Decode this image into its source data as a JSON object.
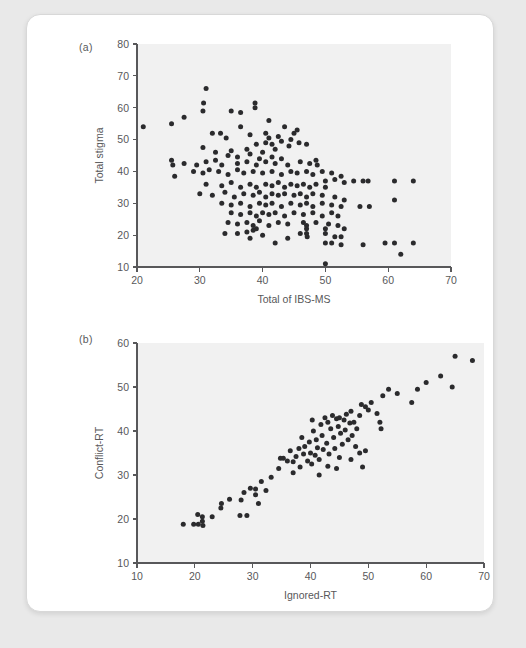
{
  "figure": {
    "panels": [
      {
        "id": "a",
        "label": "(a)",
        "xlabel": "Total of IBS-MS",
        "ylabel": "Total stigma"
      },
      {
        "id": "b",
        "label": "(b)",
        "xlabel": "Ignored-RT",
        "ylabel": "Conflict-RT"
      }
    ]
  },
  "colors": {
    "page_background": "#e9e9e9",
    "card_background": "#ffffff",
    "plot_background": "#f1f1f1",
    "point_color": "#2b2b2d",
    "axis_color": "#58585a",
    "text_color": "#58585a"
  },
  "chart_data": [
    {
      "type": "scatter",
      "panel": "a",
      "title": "(a)",
      "xlabel": "Total of IBS-MS",
      "ylabel": "Total stigma",
      "xlim": [
        20,
        70
      ],
      "ylim": [
        10,
        80
      ],
      "xticks": [
        20,
        30,
        40,
        50,
        60,
        70
      ],
      "yticks": [
        10,
        20,
        30,
        40,
        50,
        60,
        70,
        80
      ],
      "grid": false,
      "legend": "none",
      "relationship": "negative",
      "points": [
        [
          21.0,
          54.0
        ],
        [
          25.5,
          55.0
        ],
        [
          27.5,
          57.0
        ],
        [
          31.0,
          66.0
        ],
        [
          30.5,
          59.0
        ],
        [
          30.6,
          61.5
        ],
        [
          35.0,
          59.0
        ],
        [
          36.5,
          58.5
        ],
        [
          38.8,
          61.5
        ],
        [
          38.8,
          60.0
        ],
        [
          33.3,
          52.0
        ],
        [
          36.5,
          54.0
        ],
        [
          41.0,
          56.0
        ],
        [
          43.5,
          54.0
        ],
        [
          45.5,
          53.0
        ],
        [
          32.0,
          52.0
        ],
        [
          34.2,
          50.5
        ],
        [
          38.0,
          51.5
        ],
        [
          40.5,
          52.0
        ],
        [
          41.0,
          50.5
        ],
        [
          42.5,
          51.0
        ],
        [
          44.5,
          50.0
        ],
        [
          45.0,
          52.0
        ],
        [
          39.0,
          48.5
        ],
        [
          40.5,
          49.0
        ],
        [
          41.5,
          48.5
        ],
        [
          43.0,
          49.5
        ],
        [
          44.2,
          48.0
        ],
        [
          45.8,
          49.0
        ],
        [
          47.0,
          48.5
        ],
        [
          30.5,
          47.5
        ],
        [
          32.5,
          46.0
        ],
        [
          35.0,
          46.5
        ],
        [
          37.5,
          47.0
        ],
        [
          38.0,
          45.5
        ],
        [
          40.0,
          46.0
        ],
        [
          42.0,
          47.0
        ],
        [
          34.5,
          45.0
        ],
        [
          36.0,
          44.5
        ],
        [
          39.5,
          44.0
        ],
        [
          41.5,
          44.5
        ],
        [
          43.0,
          44.0
        ],
        [
          25.5,
          43.5
        ],
        [
          25.7,
          42.0
        ],
        [
          27.5,
          42.5
        ],
        [
          29.5,
          42.0
        ],
        [
          31.0,
          43.0
        ],
        [
          32.5,
          43.5
        ],
        [
          33.5,
          42.0
        ],
        [
          36.0,
          42.5
        ],
        [
          37.5,
          43.0
        ],
        [
          39.0,
          42.0
        ],
        [
          40.5,
          43.0
        ],
        [
          42.0,
          42.5
        ],
        [
          44.0,
          42.0
        ],
        [
          46.0,
          43.0
        ],
        [
          47.5,
          42.5
        ],
        [
          48.5,
          43.5
        ],
        [
          48.7,
          42.0
        ],
        [
          26.0,
          38.5
        ],
        [
          29.0,
          40.0
        ],
        [
          30.5,
          39.5
        ],
        [
          31.5,
          40.5
        ],
        [
          33.0,
          40.0
        ],
        [
          34.5,
          39.0
        ],
        [
          36.0,
          40.5
        ],
        [
          37.0,
          39.5
        ],
        [
          38.5,
          40.0
        ],
        [
          40.0,
          39.5
        ],
        [
          41.5,
          40.0
        ],
        [
          43.0,
          39.0
        ],
        [
          44.5,
          40.0
        ],
        [
          45.5,
          39.5
        ],
        [
          47.0,
          40.0
        ],
        [
          48.0,
          39.0
        ],
        [
          49.5,
          40.0
        ],
        [
          51.0,
          39.5
        ],
        [
          52.5,
          38.5
        ],
        [
          54.5,
          37.0
        ],
        [
          56.0,
          37.0
        ],
        [
          56.8,
          37.0
        ],
        [
          61.0,
          37.0
        ],
        [
          64.0,
          37.0
        ],
        [
          51.5,
          37.5
        ],
        [
          53.0,
          36.5
        ],
        [
          50.0,
          37.0
        ],
        [
          31.0,
          36.0
        ],
        [
          33.5,
          35.5
        ],
        [
          35.0,
          36.5
        ],
        [
          36.5,
          35.0
        ],
        [
          38.0,
          36.0
        ],
        [
          39.0,
          35.0
        ],
        [
          40.5,
          36.0
        ],
        [
          41.5,
          35.5
        ],
        [
          42.5,
          36.5
        ],
        [
          43.5,
          35.0
        ],
        [
          44.5,
          36.0
        ],
        [
          45.5,
          35.5
        ],
        [
          46.5,
          36.0
        ],
        [
          47.5,
          35.0
        ],
        [
          48.5,
          36.0
        ],
        [
          50.0,
          35.0
        ],
        [
          30.0,
          33.0
        ],
        [
          32.0,
          32.5
        ],
        [
          34.0,
          33.5
        ],
        [
          35.5,
          32.0
        ],
        [
          37.0,
          33.0
        ],
        [
          38.5,
          32.5
        ],
        [
          39.5,
          33.5
        ],
        [
          40.5,
          32.0
        ],
        [
          41.5,
          33.0
        ],
        [
          42.5,
          32.5
        ],
        [
          43.5,
          33.0
        ],
        [
          45.0,
          32.5
        ],
        [
          46.0,
          33.0
        ],
        [
          47.0,
          32.0
        ],
        [
          48.0,
          33.0
        ],
        [
          49.5,
          32.5
        ],
        [
          51.5,
          32.0
        ],
        [
          53.0,
          31.0
        ],
        [
          61.0,
          31.0
        ],
        [
          33.5,
          30.0
        ],
        [
          35.0,
          29.5
        ],
        [
          36.5,
          30.0
        ],
        [
          38.0,
          29.0
        ],
        [
          39.5,
          30.0
        ],
        [
          40.5,
          29.5
        ],
        [
          41.5,
          30.0
        ],
        [
          43.0,
          29.0
        ],
        [
          44.5,
          30.0
        ],
        [
          46.0,
          29.5
        ],
        [
          47.0,
          30.0
        ],
        [
          48.0,
          29.0
        ],
        [
          49.5,
          30.0
        ],
        [
          51.0,
          29.5
        ],
        [
          52.5,
          29.0
        ],
        [
          55.5,
          29.0
        ],
        [
          57.0,
          29.0
        ],
        [
          35.0,
          27.0
        ],
        [
          36.5,
          26.5
        ],
        [
          38.0,
          27.0
        ],
        [
          39.0,
          26.0
        ],
        [
          40.0,
          27.0
        ],
        [
          41.0,
          26.5
        ],
        [
          42.0,
          27.0
        ],
        [
          43.5,
          26.0
        ],
        [
          45.0,
          27.0
        ],
        [
          46.5,
          26.5
        ],
        [
          48.0,
          27.0
        ],
        [
          49.5,
          26.0
        ],
        [
          51.0,
          27.0
        ],
        [
          52.0,
          26.0
        ],
        [
          34.5,
          24.0
        ],
        [
          36.0,
          23.5
        ],
        [
          37.5,
          24.0
        ],
        [
          38.5,
          23.0
        ],
        [
          39.5,
          24.5
        ],
        [
          41.0,
          23.0
        ],
        [
          42.5,
          24.0
        ],
        [
          44.0,
          23.5
        ],
        [
          46.5,
          24.0
        ],
        [
          47.0,
          23.0
        ],
        [
          48.5,
          24.0
        ],
        [
          50.5,
          23.5
        ],
        [
          52.0,
          23.0
        ],
        [
          53.0,
          22.0
        ],
        [
          34.0,
          20.5
        ],
        [
          36.0,
          20.5
        ],
        [
          37.5,
          21.0
        ],
        [
          38.5,
          21.5
        ],
        [
          39.0,
          22.0
        ],
        [
          38.0,
          19.0
        ],
        [
          40.0,
          20.0
        ],
        [
          42.0,
          17.5
        ],
        [
          44.0,
          19.0
        ],
        [
          46.0,
          20.5
        ],
        [
          47.0,
          22.0
        ],
        [
          47.0,
          20.5
        ],
        [
          47.1,
          19.5
        ],
        [
          50.0,
          22.0
        ],
        [
          50.0,
          20.5
        ],
        [
          51.5,
          19.5
        ],
        [
          52.5,
          19.5
        ],
        [
          50.0,
          17.5
        ],
        [
          51.0,
          17.5
        ],
        [
          52.5,
          17.0
        ],
        [
          56.0,
          17.0
        ],
        [
          59.5,
          17.5
        ],
        [
          61.0,
          17.5
        ],
        [
          64.0,
          17.5
        ],
        [
          62.0,
          14.0
        ],
        [
          50.0,
          11.0
        ]
      ]
    },
    {
      "type": "scatter",
      "panel": "b",
      "title": "(b)",
      "xlabel": "Ignored-RT",
      "ylabel": "Conflict-RT",
      "xlim": [
        10,
        70
      ],
      "ylim": [
        10,
        60
      ],
      "xticks": [
        10,
        20,
        30,
        40,
        50,
        60,
        70
      ],
      "yticks": [
        10,
        20,
        30,
        40,
        50,
        60
      ],
      "grid": false,
      "legend": "none",
      "relationship": "positive",
      "points": [
        [
          18.0,
          18.8
        ],
        [
          19.8,
          18.8
        ],
        [
          20.6,
          18.8
        ],
        [
          21.3,
          19.5
        ],
        [
          21.3,
          20.5
        ],
        [
          21.4,
          18.5
        ],
        [
          20.5,
          21.0
        ],
        [
          23.0,
          20.5
        ],
        [
          24.5,
          22.5
        ],
        [
          24.6,
          23.5
        ],
        [
          26.0,
          24.5
        ],
        [
          28.0,
          24.3
        ],
        [
          27.8,
          20.8
        ],
        [
          29.0,
          20.8
        ],
        [
          28.5,
          26.0
        ],
        [
          29.6,
          27.0
        ],
        [
          30.5,
          25.5
        ],
        [
          30.5,
          26.8
        ],
        [
          31.5,
          28.5
        ],
        [
          32.3,
          26.5
        ],
        [
          31.0,
          23.5
        ],
        [
          33.2,
          29.5
        ],
        [
          34.5,
          31.5
        ],
        [
          34.8,
          33.8
        ],
        [
          35.3,
          33.8
        ],
        [
          36.5,
          35.5
        ],
        [
          37.0,
          33.0
        ],
        [
          37.5,
          34.2
        ],
        [
          38.0,
          36.0
        ],
        [
          38.2,
          31.8
        ],
        [
          38.5,
          38.5
        ],
        [
          38.8,
          34.8
        ],
        [
          39.0,
          36.5
        ],
        [
          39.5,
          33.2
        ],
        [
          39.8,
          37.5
        ],
        [
          40.0,
          35.0
        ],
        [
          40.2,
          32.5
        ],
        [
          40.3,
          42.5
        ],
        [
          40.5,
          40.0
        ],
        [
          40.8,
          34.5
        ],
        [
          41.0,
          38.0
        ],
        [
          41.2,
          36.2
        ],
        [
          41.5,
          33.5
        ],
        [
          41.8,
          41.5
        ],
        [
          42.0,
          39.0
        ],
        [
          42.2,
          35.8
        ],
        [
          42.5,
          43.0
        ],
        [
          42.8,
          37.2
        ],
        [
          43.0,
          42.0
        ],
        [
          43.2,
          34.8
        ],
        [
          43.5,
          40.5
        ],
        [
          43.8,
          43.5
        ],
        [
          44.0,
          38.5
        ],
        [
          44.2,
          36.0
        ],
        [
          44.5,
          42.8
        ],
        [
          44.8,
          41.0
        ],
        [
          45.0,
          43.0
        ],
        [
          45.2,
          39.5
        ],
        [
          45.5,
          37.0
        ],
        [
          45.8,
          42.5
        ],
        [
          46.0,
          40.2
        ],
        [
          46.2,
          43.8
        ],
        [
          46.5,
          38.0
        ],
        [
          46.8,
          41.8
        ],
        [
          47.0,
          44.5
        ],
        [
          47.2,
          39.0
        ],
        [
          47.5,
          42.0
        ],
        [
          47.8,
          36.5
        ],
        [
          48.0,
          40.5
        ],
        [
          48.5,
          43.5
        ],
        [
          44.5,
          31.5
        ],
        [
          45.0,
          34.0
        ],
        [
          47.0,
          33.5
        ],
        [
          48.5,
          35.0
        ],
        [
          49.0,
          31.8
        ],
        [
          50.0,
          44.8
        ],
        [
          49.5,
          45.5
        ],
        [
          50.5,
          46.5
        ],
        [
          48.8,
          46.0
        ],
        [
          51.5,
          44.0
        ],
        [
          52.0,
          42.0
        ],
        [
          52.2,
          40.5
        ],
        [
          53.5,
          49.5
        ],
        [
          52.5,
          48.0
        ],
        [
          55.0,
          48.5
        ],
        [
          57.5,
          46.5
        ],
        [
          60.0,
          51.0
        ],
        [
          58.5,
          49.5
        ],
        [
          62.5,
          52.5
        ],
        [
          65.0,
          57.0
        ],
        [
          68.0,
          56.0
        ],
        [
          64.5,
          50.0
        ],
        [
          37.0,
          30.5
        ],
        [
          36.0,
          33.2
        ],
        [
          41.5,
          30.0
        ],
        [
          43.0,
          32.0
        ],
        [
          49.5,
          35.5
        ]
      ]
    }
  ]
}
